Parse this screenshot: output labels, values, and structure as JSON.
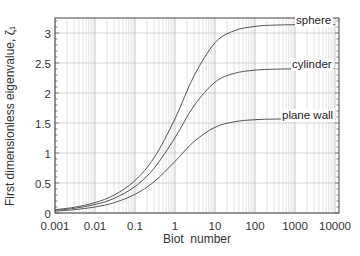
{
  "chart_data": {
    "type": "line",
    "title": "",
    "xlabel": "Biot  number",
    "ylabel": "First dimensionless eigenvalue, ζ₁",
    "xscale": "log",
    "xlim": [
      0.001,
      10000
    ],
    "ylim": [
      0,
      3.25
    ],
    "grid": true,
    "legend_position": "inline labels at right end of curves",
    "x_ticks": [
      "0.001",
      "0.01",
      "0.1",
      "1",
      "10",
      "100",
      "1000",
      "10000"
    ],
    "x_tick_values": [
      0.001,
      0.01,
      0.1,
      1,
      10,
      100,
      1000,
      10000
    ],
    "y_ticks": [
      "0",
      "0.5",
      "1",
      "1.5",
      "2",
      "2.5",
      "3"
    ],
    "y_tick_values": [
      0,
      0.5,
      1,
      1.5,
      2,
      2.5,
      3
    ],
    "x": [
      0.001,
      0.003,
      0.01,
      0.03,
      0.1,
      0.3,
      1,
      3,
      10,
      30,
      100,
      300,
      1000,
      3000,
      10000
    ],
    "series": [
      {
        "name": "sphere",
        "values": [
          0.0548,
          0.0948,
          0.173,
          0.2991,
          0.5423,
          0.9208,
          1.5708,
          2.2889,
          2.8363,
          3.0372,
          3.1102,
          3.1312,
          3.1385,
          3.1405,
          3.1413
        ]
      },
      {
        "name": "cylinder",
        "values": [
          0.0447,
          0.0774,
          0.1412,
          0.2439,
          0.4417,
          0.7465,
          1.2558,
          1.7887,
          2.1795,
          2.3261,
          2.3809,
          2.397,
          2.4024,
          2.404,
          2.4046
        ]
      },
      {
        "name": "plane wall",
        "values": [
          0.0316,
          0.0547,
          0.0998,
          0.1723,
          0.3111,
          0.5218,
          0.8603,
          1.1925,
          1.4289,
          1.5202,
          1.5552,
          1.5656,
          1.5692,
          1.5703,
          1.5706
        ]
      }
    ],
    "colors": {
      "curve": "#555555",
      "grid": "#c8c8c8",
      "frame": "#444444"
    }
  }
}
